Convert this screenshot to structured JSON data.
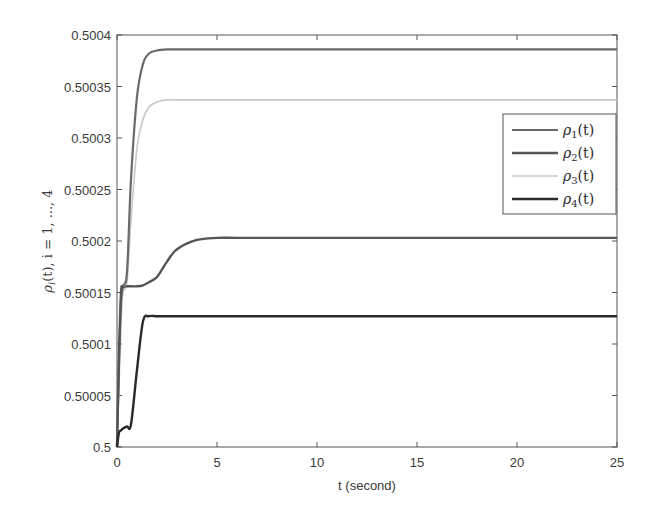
{
  "chart_data": {
    "type": "line",
    "title": "",
    "xlabel": "t (second)",
    "ylabel": "ρ_i(t), i = 1, ..., 4",
    "xlim": [
      0,
      25
    ],
    "ylim": [
      0.5,
      0.5004
    ],
    "grid": false,
    "legend_position": "upper right (inside, offset)",
    "x_ticks": [
      "0",
      "5",
      "10",
      "15",
      "20",
      "25"
    ],
    "y_ticks": [
      "0.5",
      "0.50005",
      "0.5001",
      "0.50015",
      "0.5002",
      "0.50025",
      "0.5003",
      "0.50035",
      "0.5004"
    ],
    "x": [
      0,
      0.1,
      0.2,
      0.3,
      0.5,
      0.7,
      1.0,
      1.3,
      1.6,
      2.0,
      2.5,
      3.0,
      4.0,
      5.0,
      6.0,
      8.0,
      10,
      15,
      20,
      25
    ],
    "series": [
      {
        "name": "ρ1(t)",
        "color": "#6a6a6a",
        "values": [
          0.5,
          0.50008,
          0.50014,
          0.500156,
          0.50017,
          0.50026,
          0.50034,
          0.500372,
          0.500382,
          0.500385,
          0.500386,
          0.500386,
          0.500386,
          0.500386,
          0.500386,
          0.500386,
          0.500386,
          0.500386,
          0.500386,
          0.500386
        ]
      },
      {
        "name": "ρ2(t)",
        "color": "#555555",
        "values": [
          0.5,
          0.50009,
          0.50015,
          0.500155,
          0.500156,
          0.500156,
          0.500156,
          0.500157,
          0.50016,
          0.500165,
          0.50018,
          0.500192,
          0.500201,
          0.500203,
          0.500203,
          0.500203,
          0.500203,
          0.500203,
          0.500203,
          0.500203
        ]
      },
      {
        "name": "ρ3(t)",
        "color": "#c8c8c8",
        "values": [
          0.5,
          0.50006,
          0.50012,
          0.50015,
          0.50016,
          0.50022,
          0.50029,
          0.500318,
          0.50033,
          0.500335,
          0.500337,
          0.500337,
          0.500337,
          0.500337,
          0.500337,
          0.500337,
          0.500337,
          0.500337,
          0.500337,
          0.500337
        ]
      },
      {
        "name": "ρ4(t)",
        "color": "#2a2a2a",
        "values": [
          0.5,
          0.500014,
          0.500016,
          0.500018,
          0.50002,
          0.500022,
          0.500075,
          0.500122,
          0.500127,
          0.500127,
          0.500127,
          0.500127,
          0.500127,
          0.500127,
          0.500127,
          0.500127,
          0.500127,
          0.500127,
          0.500127,
          0.500127
        ]
      }
    ]
  },
  "legend": {
    "items": [
      {
        "label": "ρ1(t)",
        "sym": "ρ",
        "sub": "1",
        "arg": "(t)"
      },
      {
        "label": "ρ2(t)",
        "sym": "ρ",
        "sub": "2",
        "arg": "(t)"
      },
      {
        "label": "ρ3(t)",
        "sym": "ρ",
        "sub": "3",
        "arg": "(t)"
      },
      {
        "label": "ρ4(t)",
        "sym": "ρ",
        "sub": "4",
        "arg": "(t)"
      }
    ]
  },
  "axes": {
    "xlabel": "t (second)",
    "ylabel_sym": "ρ",
    "ylabel_sub": "i",
    "ylabel_rest": "(t), i = 1, ..., 4"
  }
}
